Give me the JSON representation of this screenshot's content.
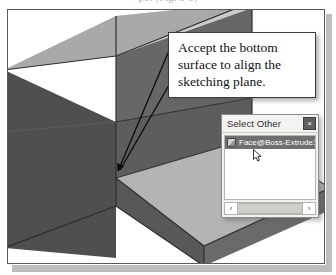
{
  "page": {
    "caption_remnant": "pot (Fig. 3-5)"
  },
  "callout": {
    "text": "Accept the bottom surface to align the sketching plane."
  },
  "dialog": {
    "title": "Select Other",
    "close_label": "×",
    "items": [
      {
        "label": "Face@Boss-Extrude1@",
        "icon": "face-icon"
      }
    ],
    "scrollbar": {
      "left_arrow": "‹",
      "right_arrow": "›"
    }
  },
  "viewport": {
    "model_name": "stepped-block",
    "colors": {
      "top_face": "#b9b9b9",
      "left_face": "#555555",
      "front_face": "#616161",
      "inner_floor": "#b0b0b0",
      "inner_wall": "#5e5e5e",
      "dark_edge": "#3a3a3a"
    }
  },
  "leader": {
    "arrow_tip_label": "bottom-surface-pick-point"
  }
}
